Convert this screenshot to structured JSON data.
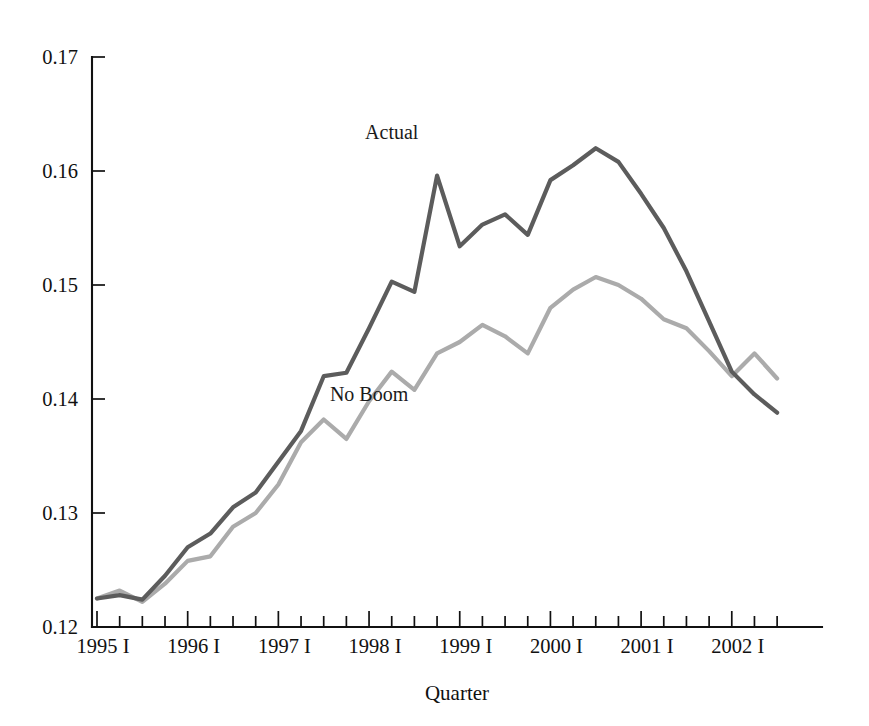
{
  "chart_data": {
    "type": "line",
    "title": "",
    "xlabel": "Quarter",
    "ylabel": "",
    "ylim": [
      0.12,
      0.17
    ],
    "yticks": [
      0.12,
      0.13,
      0.14,
      0.15,
      0.16,
      0.17
    ],
    "ytick_labels": [
      "0.12",
      "0.13",
      "0.14",
      "0.15",
      "0.16",
      "0.17"
    ],
    "grid": false,
    "legend_position": "inline-annotations",
    "x": [
      "1995 I",
      "1995 II",
      "1995 III",
      "1995 IV",
      "1996 I",
      "1996 II",
      "1996 III",
      "1996 IV",
      "1997 I",
      "1997 II",
      "1997 III",
      "1997 IV",
      "1998 I",
      "1998 II",
      "1998 III",
      "1998 IV",
      "1999 I",
      "1999 II",
      "1999 III",
      "1999 IV",
      "2000 I",
      "2000 II",
      "2000 III",
      "2000 IV",
      "2001 I",
      "2001 II",
      "2001 III",
      "2001 IV",
      "2002 I",
      "2002 II",
      "2002 III"
    ],
    "xtick_labels": [
      "1995 I",
      "1996 I",
      "1997 I",
      "1998 I",
      "1999 I",
      "2000 I",
      "2001 I",
      "2002 I"
    ],
    "xtick_label_indices": [
      0,
      4,
      8,
      12,
      16,
      20,
      24,
      28
    ],
    "series": [
      {
        "name": "Actual",
        "color": "#5c5c5c",
        "label_x_index": 13,
        "label_value": 0.1628,
        "values": [
          0.1225,
          0.1228,
          0.1224,
          0.1245,
          0.127,
          0.1282,
          0.1305,
          0.1318,
          0.1345,
          0.1372,
          0.142,
          0.1423,
          0.1462,
          0.1503,
          0.1494,
          0.1596,
          0.1534,
          0.1553,
          0.1562,
          0.1544,
          0.1592,
          0.1605,
          0.162,
          0.1608,
          0.158,
          0.155,
          0.1512,
          0.1468,
          0.1424,
          0.1404,
          0.1388
        ]
      },
      {
        "name": "No Boom",
        "color": "#ababab",
        "label_x_index": 12,
        "label_value": 0.1398,
        "values": [
          0.1225,
          0.1232,
          0.1222,
          0.1238,
          0.1258,
          0.1262,
          0.1288,
          0.13,
          0.1325,
          0.1362,
          0.1382,
          0.1365,
          0.1398,
          0.1424,
          0.1408,
          0.144,
          0.145,
          0.1465,
          0.1455,
          0.144,
          0.148,
          0.1496,
          0.1507,
          0.15,
          0.1488,
          0.147,
          0.1462,
          0.1442,
          0.142,
          0.144,
          0.1418
        ]
      }
    ]
  },
  "annotations": {
    "actual_label": "Actual",
    "no_boom_label": "No Boom"
  },
  "axis": {
    "x_title": "Quarter"
  }
}
